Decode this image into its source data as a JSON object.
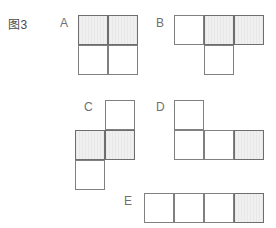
{
  "figure": {
    "caption": "图3",
    "cell_size": 30,
    "colors": {
      "background": "#ffffff",
      "cell_fill_plain": "#ffffff",
      "cell_fill_shaded": "#f0f0f0",
      "cell_border": "#808080",
      "label_text": "#6f6f6f",
      "caption_text": "#4a4a4a"
    },
    "shapes": [
      {
        "label": "A",
        "label_x": 60,
        "label_y": 16,
        "origin_x": 78,
        "origin_y": 15,
        "type": "square-tetromino",
        "cells": [
          {
            "col": 0,
            "row": 0,
            "shaded": true
          },
          {
            "col": 1,
            "row": 0,
            "shaded": true
          },
          {
            "col": 0,
            "row": 1,
            "shaded": false
          },
          {
            "col": 1,
            "row": 1,
            "shaded": false
          }
        ]
      },
      {
        "label": "B",
        "label_x": 156,
        "label_y": 16,
        "origin_x": 174,
        "origin_y": 15,
        "type": "t-tetromino",
        "cells": [
          {
            "col": 0,
            "row": 0,
            "shaded": false
          },
          {
            "col": 1,
            "row": 0,
            "shaded": true
          },
          {
            "col": 2,
            "row": 0,
            "shaded": true
          },
          {
            "col": 1,
            "row": 1,
            "shaded": false
          }
        ]
      },
      {
        "label": "C",
        "label_x": 84,
        "label_y": 100,
        "origin_x": 75,
        "origin_y": 100,
        "type": "s-tetromino",
        "cells": [
          {
            "col": 1,
            "row": 0,
            "shaded": false
          },
          {
            "col": 0,
            "row": 1,
            "shaded": true
          },
          {
            "col": 1,
            "row": 1,
            "shaded": true
          },
          {
            "col": 0,
            "row": 2,
            "shaded": false
          }
        ]
      },
      {
        "label": "D",
        "label_x": 156,
        "label_y": 100,
        "origin_x": 174,
        "origin_y": 100,
        "type": "j-tetromino",
        "cells": [
          {
            "col": 0,
            "row": 0,
            "shaded": false
          },
          {
            "col": 0,
            "row": 1,
            "shaded": false
          },
          {
            "col": 1,
            "row": 1,
            "shaded": false
          },
          {
            "col": 2,
            "row": 1,
            "shaded": true
          }
        ]
      },
      {
        "label": "E",
        "label_x": 124,
        "label_y": 194,
        "origin_x": 144,
        "origin_y": 193,
        "type": "i-tetromino",
        "cells": [
          {
            "col": 0,
            "row": 0,
            "shaded": false
          },
          {
            "col": 1,
            "row": 0,
            "shaded": false
          },
          {
            "col": 2,
            "row": 0,
            "shaded": false
          },
          {
            "col": 3,
            "row": 0,
            "shaded": true
          }
        ]
      }
    ]
  }
}
